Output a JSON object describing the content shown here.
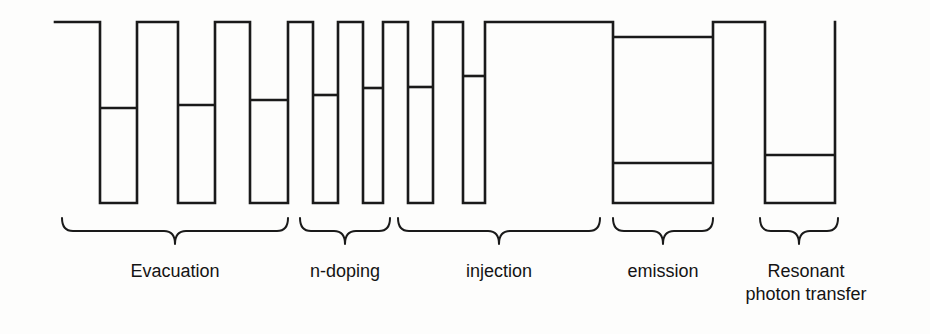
{
  "figure": {
    "background_color": "#fdfdfc",
    "line_color": "#1a1a1a",
    "text_color": "#141414"
  },
  "chart_data": {
    "type": "diagram",
    "title": "",
    "xlabel": "",
    "ylabel": "",
    "geometry": {
      "barrier_top_y": 22,
      "well_bottom_y": 203,
      "profile_left_x": 55,
      "profile_right_x": 835
    },
    "wells": [
      {
        "index": 1,
        "region": "Evacuation",
        "x0": 100,
        "x1": 137,
        "bottom_y": 203,
        "levels_y": [
          108
        ]
      },
      {
        "index": 2,
        "region": "Evacuation",
        "x0": 178,
        "x1": 215,
        "bottom_y": 203,
        "levels_y": [
          105
        ]
      },
      {
        "index": 3,
        "region": "Evacuation",
        "x0": 250,
        "x1": 288,
        "bottom_y": 203,
        "levels_y": [
          100
        ]
      },
      {
        "index": 4,
        "region": "n-doping",
        "x0": 313,
        "x1": 338,
        "bottom_y": 203,
        "levels_y": [
          95
        ]
      },
      {
        "index": 5,
        "region": "n-doping",
        "x0": 363,
        "x1": 383,
        "bottom_y": 203,
        "levels_y": [
          88
        ]
      },
      {
        "index": 6,
        "region": "injection",
        "x0": 408,
        "x1": 433,
        "bottom_y": 203,
        "levels_y": [
          87
        ]
      },
      {
        "index": 7,
        "region": "injection",
        "x0": 463,
        "x1": 485,
        "bottom_y": 203,
        "levels_y": [
          76
        ]
      },
      {
        "index": 8,
        "region": "emission",
        "x0": 613,
        "x1": 713,
        "bottom_y": 203,
        "levels_y": [
          37,
          163
        ]
      },
      {
        "index": 9,
        "region": "Resonant photon transfer",
        "x0": 765,
        "x1": 835,
        "bottom_y": 203,
        "levels_y": [
          155
        ]
      }
    ],
    "regions": [
      {
        "name": "Evacuation",
        "brace_x0": 62,
        "brace_x1": 288,
        "label_x": 175,
        "label_y": 277,
        "lines": [
          "Evacuation"
        ]
      },
      {
        "name": "n-doping",
        "brace_x0": 300,
        "brace_x1": 390,
        "label_x": 345,
        "label_y": 277,
        "lines": [
          "n-doping"
        ]
      },
      {
        "name": "injection",
        "brace_x0": 398,
        "brace_x1": 600,
        "label_x": 499,
        "label_y": 277,
        "lines": [
          "injection"
        ]
      },
      {
        "name": "emission",
        "brace_x0": 613,
        "brace_x1": 713,
        "label_x": 663,
        "label_y": 277,
        "lines": [
          "emission"
        ]
      },
      {
        "name": "Resonant photon transfer",
        "brace_x0": 760,
        "brace_x1": 838,
        "label_x": 806,
        "label_y": 277,
        "lines": [
          "Resonant",
          "photon transfer"
        ]
      }
    ]
  },
  "labels": {
    "evacuation": "Evacuation",
    "n_doping": "n-doping",
    "injection": "injection",
    "emission": "emission",
    "resonant_line1": "Resonant",
    "resonant_line2": "photon transfer"
  }
}
